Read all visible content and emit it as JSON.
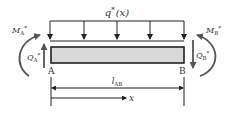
{
  "diagram": {
    "type": "beam-element-free-body",
    "load": {
      "symbol": "q",
      "superscript": "*",
      "argument": "(x)"
    },
    "nodes": [
      {
        "label": "A"
      },
      {
        "label": "B"
      }
    ],
    "left_end": {
      "moment": {
        "symbol": "M",
        "subscript": "A",
        "superscript": "*"
      },
      "shear": {
        "symbol": "Q",
        "subscript": "A",
        "superscript": "*"
      }
    },
    "right_end": {
      "moment": {
        "symbol": "M",
        "subscript": "B",
        "superscript": "*"
      },
      "shear": {
        "symbol": "Q",
        "subscript": "B",
        "superscript": "*"
      }
    },
    "length": {
      "symbol": "l",
      "subscript": "AB"
    },
    "coordinate": {
      "symbol": "x"
    },
    "colors": {
      "line": "#222222",
      "force_arrow": "#555555",
      "beam_fill": "#d9d9d9",
      "label": "#333333"
    }
  }
}
